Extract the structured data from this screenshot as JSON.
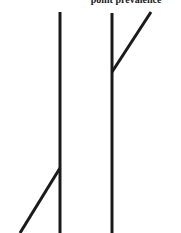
{
  "diagram": {
    "caption": "point prevalence",
    "line_color": "#1a1a1a",
    "line_width": 3,
    "figures": [
      {
        "name": "left-figure",
        "trunk": {
          "x1": 60,
          "y1": 12,
          "x2": 60,
          "y2": 233
        },
        "branch": {
          "x1": 60,
          "y1": 168,
          "x2": 20,
          "y2": 233
        }
      },
      {
        "name": "right-figure",
        "trunk": {
          "x1": 112,
          "y1": 13,
          "x2": 112,
          "y2": 233
        },
        "branch": {
          "x1": 112,
          "y1": 72,
          "x2": 151,
          "y2": 12
        }
      }
    ]
  }
}
